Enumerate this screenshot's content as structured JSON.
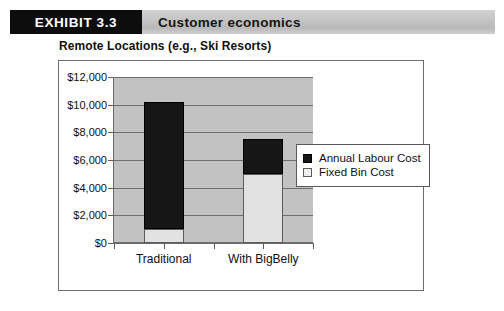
{
  "exhibit": {
    "tag": "EXHIBIT 3.3",
    "title": "Customer economics"
  },
  "subtitle": "Remote Locations (e.g., Ski Resorts)",
  "chart_data": {
    "type": "bar",
    "stacked": true,
    "title": "Remote Locations (e.g., Ski Resorts)",
    "xlabel": "",
    "ylabel": "",
    "categories": [
      "Traditional",
      "With BigBelly"
    ],
    "series": [
      {
        "name": "Fixed Bin Cost",
        "values": [
          1000,
          5000
        ],
        "color": "#e2e2e2"
      },
      {
        "name": "Annual Labour Cost",
        "values": [
          9200,
          2500
        ],
        "color": "#161616"
      }
    ],
    "totals": [
      10200,
      7500
    ],
    "ylim": [
      0,
      12000
    ],
    "ytick_values": [
      0,
      2000,
      4000,
      6000,
      8000,
      10000,
      12000
    ],
    "ytick_labels": [
      "$0",
      "$2,000",
      "$4,000",
      "$6,000",
      "$8,000",
      "$10,000",
      "$12,000"
    ],
    "grid": true,
    "legend_position": "right",
    "legend_entries": [
      {
        "label": "Annual Labour Cost",
        "swatch": "dark"
      },
      {
        "label": "Fixed Bin Cost",
        "swatch": "light"
      }
    ],
    "plot_background": "#c2c2c2"
  }
}
